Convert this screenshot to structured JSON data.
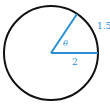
{
  "diagram": {
    "type": "circle-sector",
    "labels": {
      "angle": "θ",
      "arc_length": "1.5",
      "radius": "2"
    },
    "colors": {
      "circle": "#111111",
      "radii": "#2a8fd0",
      "labels": "#2a8fd0"
    }
  }
}
